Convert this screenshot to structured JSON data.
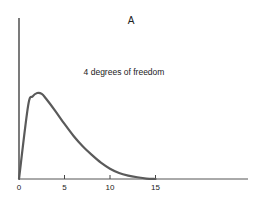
{
  "chart_data": {
    "type": "line",
    "title": "A",
    "annotation": "4 degrees of freedom",
    "xlabel": "",
    "ylabel": "",
    "xlim": [
      0,
      25
    ],
    "ylim": [
      0,
      1
    ],
    "grid": false,
    "x_ticks": [
      0,
      5,
      10,
      15
    ],
    "x_tick_labels": [
      "0",
      "5",
      "10",
      "15"
    ],
    "series": [
      {
        "name": "4 degrees of freedom",
        "x": [
          0,
          1,
          1.5,
          2,
          2.5,
          3,
          4,
          5,
          6,
          7,
          8,
          9,
          10,
          11,
          12,
          13,
          14,
          15
        ],
        "values": [
          0,
          0.85,
          0.96,
          1.0,
          0.99,
          0.93,
          0.79,
          0.64,
          0.5,
          0.38,
          0.28,
          0.19,
          0.12,
          0.07,
          0.04,
          0.02,
          0.005,
          0
        ]
      }
    ],
    "colors": {
      "curve": "#555555",
      "axis": "#333333"
    }
  }
}
